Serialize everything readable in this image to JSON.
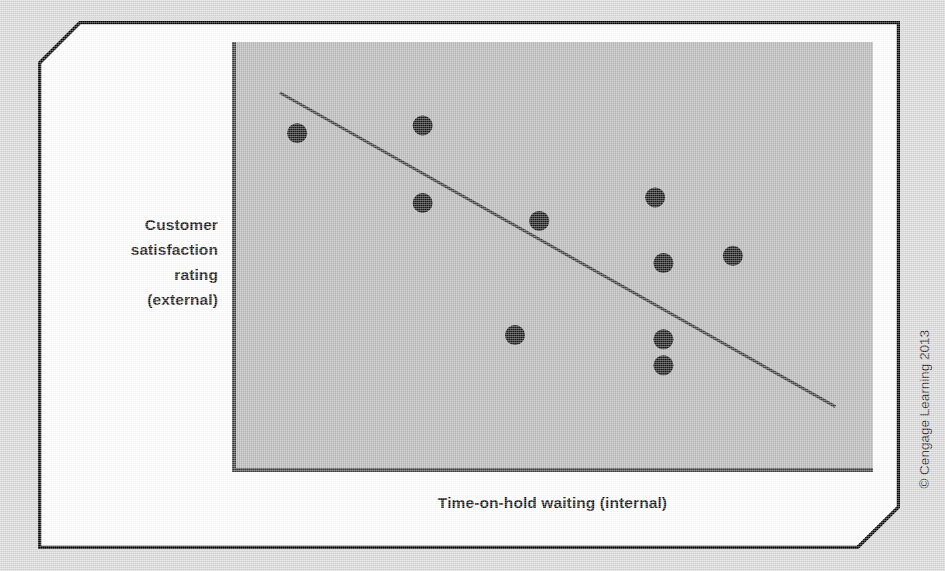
{
  "figure": {
    "card_background": "#ffffff",
    "page_background": "#d9d9d9",
    "border_color": "#000000"
  },
  "axis_labels": {
    "y_lines": [
      "Customer",
      "satisfaction",
      "rating",
      "(external)"
    ],
    "y_full": "Customer satisfaction rating (external)",
    "x": "Time-on-hold waiting (internal)"
  },
  "credit": {
    "text": "© Cengage Learning 2013"
  },
  "chart_data": {
    "type": "scatter",
    "title": "",
    "xlabel": "Time-on-hold waiting (internal)",
    "ylabel": "Customer satisfaction rating (external)",
    "xlim": [
      0,
      100
    ],
    "ylim": [
      0,
      100
    ],
    "grid": false,
    "legend": null,
    "axis_ticks": {
      "x": [],
      "y": []
    },
    "plot_background": "#b2b2b2",
    "axis_color": "#3d3d3d",
    "point_color": "#1a1a1a",
    "point_radius": 10,
    "points": [
      {
        "x": 9.6,
        "y": 78.6
      },
      {
        "x": 29.3,
        "y": 80.4
      },
      {
        "x": 29.3,
        "y": 62.2
      },
      {
        "x": 47.6,
        "y": 58.0
      },
      {
        "x": 65.8,
        "y": 63.5
      },
      {
        "x": 67.1,
        "y": 48.1
      },
      {
        "x": 78.0,
        "y": 49.8
      },
      {
        "x": 43.8,
        "y": 31.2
      },
      {
        "x": 67.1,
        "y": 30.2
      },
      {
        "x": 67.1,
        "y": 24.1
      }
    ],
    "trend_line": {
      "type": "linear-fit",
      "color": "#3d3d3d",
      "width": 3,
      "start": {
        "x": 6.9,
        "y": 88.1
      },
      "end": {
        "x": 94.1,
        "y": 14.4
      },
      "direction": "negative"
    },
    "annotations": []
  }
}
